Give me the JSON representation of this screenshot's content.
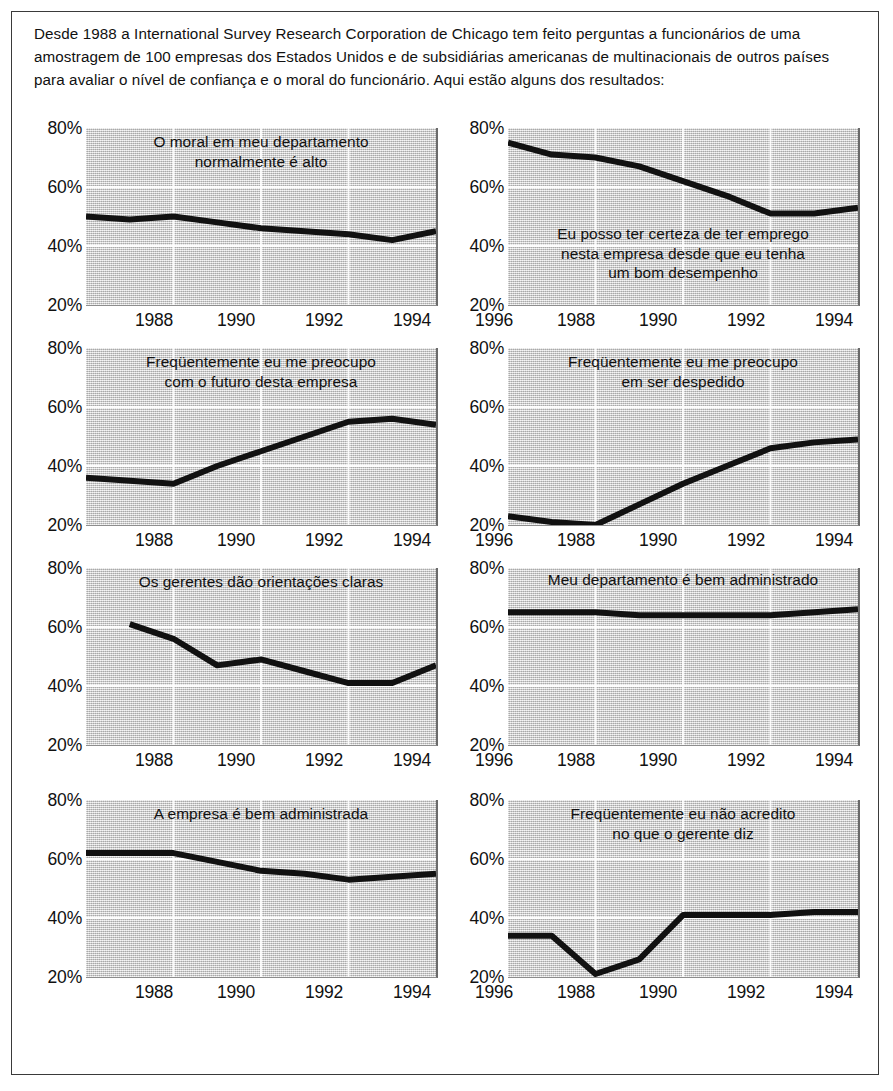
{
  "intro": {
    "paragraph": "Desde 1988 a International Survey Research Corporation de Chicago tem feito perguntas a funcionários de uma amostragem de 100 empresas dos Estados Unidos e de subsidiárias americanas de multinacionais de outros países para avaliar o nível de confiança e o moral do funcionário. Aqui estão alguns dos resultados:"
  },
  "axis": {
    "y_ticks": [
      "80%",
      "60%",
      "40%",
      "20%"
    ],
    "y_values": [
      80,
      60,
      40,
      20
    ],
    "x_ticks": [
      "1988",
      "1990",
      "1992",
      "1994",
      "1996"
    ],
    "x_values": [
      1988,
      1990,
      1992,
      1994,
      1996
    ]
  },
  "chart_data": [
    {
      "type": "line",
      "title": "O moral em meu departamento normalmente é alto",
      "title_lines": [
        "O moral em meu departamento",
        "normalmente é alto"
      ],
      "xlabel": "",
      "ylabel": "",
      "xlim": [
        1988,
        1996
      ],
      "ylim": [
        20,
        80
      ],
      "grid": true,
      "legend": "none",
      "x": [
        1988,
        1989,
        1990,
        1991,
        1992,
        1993,
        1994,
        1995,
        1996
      ],
      "values": [
        50,
        49,
        50,
        48,
        46,
        45,
        44,
        42,
        45
      ]
    },
    {
      "type": "line",
      "title": "Eu posso ter certeza de ter emprego nesta empresa desde que eu tenha um bom desempenho",
      "title_lines": [
        "Eu posso ter certeza de ter emprego",
        "nesta empresa desde que eu tenha",
        "um bom desempenho"
      ],
      "xlabel": "",
      "ylabel": "",
      "xlim": [
        1988,
        1996
      ],
      "ylim": [
        20,
        80
      ],
      "grid": true,
      "legend": "none",
      "x": [
        1988,
        1989,
        1990,
        1991,
        1992,
        1993,
        1994,
        1995,
        1996
      ],
      "values": [
        75,
        71,
        70,
        67,
        62,
        57,
        51,
        51,
        53
      ]
    },
    {
      "type": "line",
      "title": "Freqüentemente eu me preocupo com o futuro desta empresa",
      "title_lines": [
        "Freqüentemente eu me preocupo",
        "com o futuro desta empresa"
      ],
      "xlabel": "",
      "ylabel": "",
      "xlim": [
        1988,
        1996
      ],
      "ylim": [
        20,
        80
      ],
      "grid": true,
      "legend": "none",
      "x": [
        1988,
        1989,
        1990,
        1991,
        1992,
        1993,
        1994,
        1995,
        1996
      ],
      "values": [
        36,
        35,
        34,
        40,
        45,
        50,
        55,
        56,
        54
      ]
    },
    {
      "type": "line",
      "title": "Freqüentemente eu me preocupo em ser despedido",
      "title_lines": [
        "Freqüentemente eu me preocupo",
        "em ser despedido"
      ],
      "xlabel": "",
      "ylabel": "",
      "xlim": [
        1988,
        1996
      ],
      "ylim": [
        20,
        80
      ],
      "grid": true,
      "legend": "none",
      "x": [
        1988,
        1989,
        1990,
        1991,
        1992,
        1993,
        1994,
        1995,
        1996
      ],
      "values": [
        23,
        21,
        20,
        27,
        34,
        40,
        46,
        48,
        49
      ]
    },
    {
      "type": "line",
      "title": "Os gerentes dão orientações claras",
      "title_lines": [
        "Os gerentes dão orientações claras"
      ],
      "xlabel": "",
      "ylabel": "",
      "xlim": [
        1988,
        1996
      ],
      "ylim": [
        20,
        80
      ],
      "grid": true,
      "legend": "none",
      "x": [
        1989,
        1990,
        1991,
        1992,
        1993,
        1994,
        1995,
        1996
      ],
      "values": [
        61,
        56,
        47,
        49,
        45,
        41,
        41,
        47
      ]
    },
    {
      "type": "line",
      "title": "Meu departamento é bem administrado",
      "title_lines": [
        "Meu departamento é bem administrado"
      ],
      "xlabel": "",
      "ylabel": "",
      "xlim": [
        1988,
        1996
      ],
      "ylim": [
        20,
        80
      ],
      "grid": true,
      "legend": "none",
      "x": [
        1988,
        1989,
        1990,
        1991,
        1992,
        1993,
        1994,
        1995,
        1996
      ],
      "values": [
        65,
        65,
        65,
        64,
        64,
        64,
        64,
        65,
        66
      ]
    },
    {
      "type": "line",
      "title": "A empresa é bem administrada",
      "title_lines": [
        "A empresa é bem administrada"
      ],
      "xlabel": "",
      "ylabel": "",
      "xlim": [
        1988,
        1996
      ],
      "ylim": [
        20,
        80
      ],
      "grid": true,
      "legend": "none",
      "x": [
        1988,
        1989,
        1990,
        1991,
        1992,
        1993,
        1994,
        1995,
        1996
      ],
      "values": [
        62,
        62,
        62,
        59,
        56,
        55,
        53,
        54,
        55
      ]
    },
    {
      "type": "line",
      "title": "Freqüentemente eu não acredito no que o gerente diz",
      "title_lines": [
        "Freqüentemente eu não acredito",
        "no que o gerente diz"
      ],
      "xlabel": "",
      "ylabel": "",
      "xlim": [
        1988,
        1996
      ],
      "ylim": [
        20,
        80
      ],
      "grid": true,
      "legend": "none",
      "x": [
        1988,
        1989,
        1990,
        1991,
        1992,
        1993,
        1994,
        1995,
        1996
      ],
      "values": [
        34,
        34,
        21,
        26,
        41,
        41,
        41,
        42,
        42
      ]
    }
  ],
  "style": {
    "line_color": "#111111",
    "plot_background": "#d9d9d9",
    "grid_color": "#ffffff",
    "frame_color": "#3a3a3a"
  }
}
